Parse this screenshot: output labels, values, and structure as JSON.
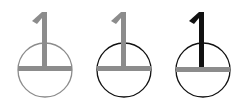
{
  "symbols": [
    {
      "label": "variant-gray",
      "digit": "1",
      "digit_color": "#8c8c8c",
      "circle_color": "#8c8c8c",
      "bar_color": "#8c8c8c",
      "cx": 45,
      "cy": 70,
      "r": 27,
      "left": 0
    },
    {
      "label": "variant-black-circle",
      "digit": "1",
      "digit_color": "#8c8c8c",
      "circle_color": "#111111",
      "bar_color": "#8c8c8c",
      "cx": 124,
      "cy": 70,
      "r": 27,
      "left": 80
    },
    {
      "label": "variant-black-digit",
      "digit": "1",
      "digit_color": "#111111",
      "circle_color": "#111111",
      "bar_color": "#8c8c8c",
      "cx": 203,
      "cy": 70,
      "r": 27,
      "left": 160
    }
  ]
}
